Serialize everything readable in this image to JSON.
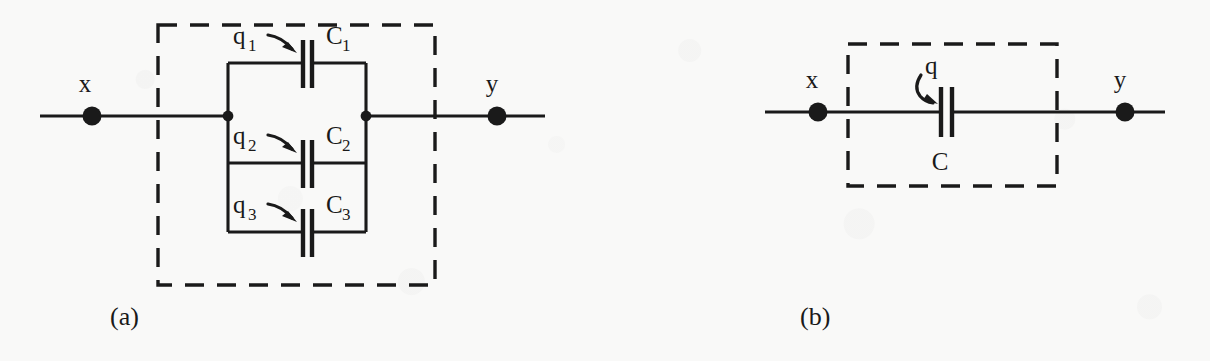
{
  "figure": {
    "background_color": "#f9f9f8",
    "ink_color": "#1a1a1a",
    "panels": [
      {
        "id": "a",
        "caption": "(a)",
        "terminal_left_label": "x",
        "terminal_right_label": "y",
        "branches": [
          {
            "charge_label": "q",
            "charge_subscript": "1",
            "capacitor_label": "C",
            "capacitor_subscript": "1"
          },
          {
            "charge_label": "q",
            "charge_subscript": "2",
            "capacitor_label": "C",
            "capacitor_subscript": "2"
          },
          {
            "charge_label": "q",
            "charge_subscript": "3",
            "capacitor_label": "C",
            "capacitor_subscript": "3"
          }
        ]
      },
      {
        "id": "b",
        "caption": "(b)",
        "terminal_left_label": "x",
        "terminal_right_label": "y",
        "branches": [
          {
            "charge_label": "q",
            "charge_subscript": "",
            "capacitor_label": "C",
            "capacitor_subscript": ""
          }
        ]
      }
    ]
  }
}
